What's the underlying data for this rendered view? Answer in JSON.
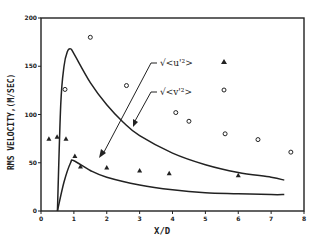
{
  "chart_data": {
    "type": "scatter",
    "title": "",
    "xlabel": "X/D",
    "ylabel": "RMS VELOCITY,(M/SEC)",
    "xlim": [
      0,
      8
    ],
    "ylim": [
      0,
      200
    ],
    "xticks": [
      0,
      1,
      2,
      3,
      4,
      5,
      6,
      7,
      8
    ],
    "yticks": [
      0,
      50,
      100,
      150,
      200
    ],
    "grid": false,
    "annotations": [
      {
        "text": "√<u'²>",
        "points_to": "upper curve"
      },
      {
        "text": "√<v'²>",
        "points_to": "lower curve"
      }
    ],
    "series": [
      {
        "name": "triangles (measured)",
        "marker": "triangle",
        "x": [
          0.24,
          0.49,
          0.76,
          1.03,
          1.2,
          2.0,
          3.0,
          3.9,
          6.0
        ],
        "y": [
          75,
          77,
          75,
          57,
          46,
          45,
          42,
          39,
          37
        ]
      },
      {
        "name": "circles (measured)",
        "marker": "circle",
        "x": [
          0.73,
          1.5,
          2.6,
          4.1,
          4.5,
          5.6,
          6.6,
          7.6
        ],
        "y": [
          126,
          180,
          130,
          102,
          93,
          80,
          74,
          61
        ]
      },
      {
        "name": "√<u'²> curve",
        "type": "line",
        "x": [
          0.5,
          0.6,
          0.7,
          0.8,
          0.9,
          1.0,
          1.5,
          2.0,
          2.5,
          3.0,
          4.0,
          5.0,
          6.0,
          7.0,
          7.4
        ],
        "y": [
          0,
          110,
          150,
          165,
          168,
          163,
          133,
          110,
          92,
          78,
          60,
          48,
          40,
          35,
          32
        ]
      },
      {
        "name": "√<v'²> curve",
        "type": "line",
        "x": [
          0.5,
          0.7,
          0.9,
          1.0,
          1.5,
          2.0,
          3.0,
          4.0,
          5.0,
          6.0,
          7.0,
          7.4
        ],
        "y": [
          0,
          30,
          50,
          52,
          42,
          35,
          27,
          22,
          19,
          18,
          17,
          17
        ]
      }
    ],
    "legend": [
      {
        "label": "√<u'²>",
        "marker": "triangle"
      },
      {
        "label": "√<v'²>",
        "marker": "circle"
      }
    ]
  },
  "labels": {
    "xlabel": "X/D",
    "ylabel": "RMS VELOCITY,(M/SEC)",
    "annot_u": "√<u'²>",
    "annot_v": "√<v'²>"
  }
}
